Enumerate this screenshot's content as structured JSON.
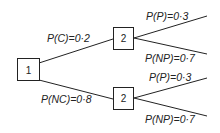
{
  "diagram": {
    "type": "probability-tree",
    "nodes": [
      {
        "id": "n1",
        "label": "1"
      },
      {
        "id": "n2a",
        "label": "2"
      },
      {
        "id": "n2b",
        "label": "2"
      }
    ],
    "branches": [
      {
        "from": "n1",
        "to": "n2a",
        "label": "P(C)=0·2"
      },
      {
        "from": "n1",
        "to": "n2b",
        "label": "P(NC)=0·8"
      },
      {
        "from": "n2a",
        "label": "P(P)=0·3"
      },
      {
        "from": "n2a",
        "label": "P(NP)=0·7"
      },
      {
        "from": "n2b",
        "label": "P(P)=0·3"
      },
      {
        "from": "n2b",
        "label": "P(NP)=0·7"
      }
    ],
    "colors": {
      "line": "#222222",
      "background": "#ffffff"
    }
  }
}
